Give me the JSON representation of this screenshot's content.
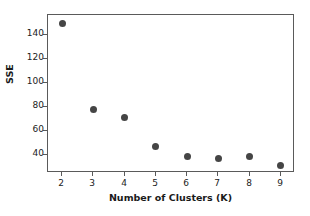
{
  "chart_data": {
    "type": "scatter",
    "title": "",
    "xlabel": "Number of Clusters (K)",
    "ylabel": "SSE",
    "x": [
      2,
      3,
      4,
      5,
      6,
      7,
      8,
      9
    ],
    "values": [
      150,
      78,
      71,
      47,
      38,
      37,
      38,
      31
    ],
    "categories": [
      "2",
      "3",
      "4",
      "5",
      "6",
      "7",
      "8",
      "9"
    ],
    "series": [
      {
        "name": "SSE",
        "values": [
          150,
          78,
          71,
          47,
          38,
          37,
          38,
          31
        ]
      }
    ],
    "points": [
      {
        "label": "K=2",
        "x": 2,
        "y": 150
      },
      {
        "label": "K=3",
        "x": 3,
        "y": 78
      },
      {
        "label": "K=4",
        "x": 4,
        "y": 71
      },
      {
        "label": "K=5",
        "x": 5,
        "y": 47
      },
      {
        "label": "K=6",
        "x": 6,
        "y": 38
      },
      {
        "label": "K=7",
        "x": 7,
        "y": 37
      },
      {
        "label": "K=8",
        "x": 8,
        "y": 38
      },
      {
        "label": "K=9",
        "x": 9,
        "y": 31
      }
    ],
    "xticks": [
      2,
      3,
      4,
      5,
      6,
      7,
      8,
      9
    ],
    "xtick_labels": [
      "2",
      "3",
      "4",
      "5",
      "6",
      "7",
      "8",
      "9"
    ],
    "yticks": [
      40,
      60,
      80,
      100,
      120,
      140
    ],
    "ytick_labels": [
      "40",
      "60",
      "80",
      "100",
      "120",
      "140"
    ],
    "xlim": [
      1.55,
      9.45
    ],
    "ylim": [
      24.5,
      157.0
    ],
    "grid": false,
    "legend": null,
    "marker_color": "#454545",
    "axis_color": "#5a5a5a",
    "background_color": "#ffffff"
  }
}
